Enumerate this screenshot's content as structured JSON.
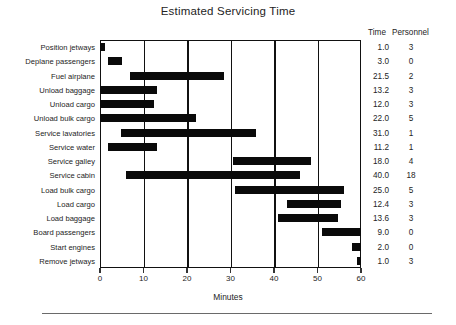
{
  "chart_data": {
    "type": "bar",
    "subtype": "gantt",
    "title": "Estimated Servicing Time",
    "xlabel": "Minutes",
    "ylabel": "",
    "xlim": [
      0,
      60
    ],
    "xticks": [
      0,
      10,
      20,
      30,
      40,
      50,
      60
    ],
    "xticklabels": [
      "0",
      "10",
      "20",
      "30",
      "40",
      "50",
      "60"
    ],
    "grid": true,
    "grid_axis": "x",
    "legend": "none",
    "bar_color": "#0a0a0a",
    "columns": [
      "Task",
      "Time",
      "Personnel"
    ],
    "column_headers": {
      "time": "Time",
      "personnel": "Personnel"
    },
    "categories": [
      "Position jetways",
      "Deplane passengers",
      "Fuel airplane",
      "Unload baggage",
      "Unload cargo",
      "Unload bulk cargo",
      "Service lavatories",
      "Service water",
      "Service galley",
      "Service cabin",
      "Load bulk cargo",
      "Load cargo",
      "Load baggage",
      "Board passengers",
      "Start engines",
      "Remove jetways"
    ],
    "time": [
      1.0,
      3.0,
      21.5,
      13.2,
      12.0,
      22.0,
      31.0,
      11.2,
      18.0,
      40.0,
      25.0,
      12.4,
      13.6,
      9.0,
      2.0,
      1.0
    ],
    "personnel": [
      3,
      0,
      2,
      3,
      3,
      5,
      1,
      1,
      4,
      18,
      5,
      3,
      3,
      0,
      0,
      3
    ],
    "bars": [
      {
        "task": "Position jetways",
        "start": 0.0,
        "end": 1.2,
        "time": "1.0",
        "personnel": "3"
      },
      {
        "task": "Deplane passengers",
        "start": 1.8,
        "end": 5.1,
        "time": "3.0",
        "personnel": "0"
      },
      {
        "task": "Fuel airplane",
        "start": 6.9,
        "end": 28.5,
        "time": "21.5",
        "personnel": "2"
      },
      {
        "task": "Unload baggage",
        "start": 0.0,
        "end": 13.2,
        "time": "13.2",
        "personnel": "3"
      },
      {
        "task": "Unload cargo",
        "start": 0.0,
        "end": 12.4,
        "time": "12.0",
        "personnel": "3"
      },
      {
        "task": "Unload bulk cargo",
        "start": 0.0,
        "end": 22.0,
        "time": "22.0",
        "personnel": "5"
      },
      {
        "task": "Service lavatories",
        "start": 4.8,
        "end": 35.8,
        "time": "31.0",
        "personnel": "1"
      },
      {
        "task": "Service water",
        "start": 1.8,
        "end": 13.0,
        "time": "11.2",
        "personnel": "1"
      },
      {
        "task": "Service galley",
        "start": 30.5,
        "end": 48.5,
        "time": "18.0",
        "personnel": "4"
      },
      {
        "task": "Service cabin",
        "start": 6.0,
        "end": 46.0,
        "time": "40.0",
        "personnel": "18"
      },
      {
        "task": "Load bulk cargo",
        "start": 31.0,
        "end": 56.0,
        "time": "25.0",
        "personnel": "5"
      },
      {
        "task": "Load cargo",
        "start": 43.0,
        "end": 55.4,
        "time": "12.4",
        "personnel": "3"
      },
      {
        "task": "Load baggage",
        "start": 41.0,
        "end": 54.6,
        "time": "13.6",
        "personnel": "3"
      },
      {
        "task": "Board passengers",
        "start": 51.0,
        "end": 60.0,
        "time": "9.0",
        "personnel": "0"
      },
      {
        "task": "Start engines",
        "start": 58.0,
        "end": 60.0,
        "time": "2.0",
        "personnel": "0"
      },
      {
        "task": "Remove jetways",
        "start": 59.0,
        "end": 60.0,
        "time": "1.0",
        "personnel": "3"
      }
    ]
  }
}
